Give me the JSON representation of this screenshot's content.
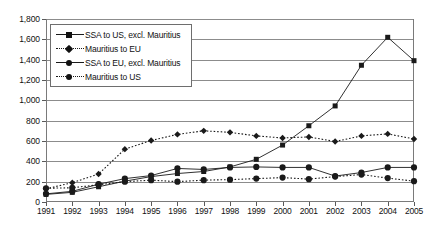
{
  "chart_data": {
    "type": "line",
    "title": "",
    "subtitle": "",
    "xlabel": "",
    "ylabel": "",
    "grid": true,
    "legend_position": "top-left",
    "xlim": [
      1991,
      2005
    ],
    "ylim": [
      0,
      1800
    ],
    "ytick_step": 200,
    "categories": [
      1991,
      1992,
      1993,
      1994,
      1995,
      1996,
      1997,
      1998,
      1999,
      2000,
      2001,
      2002,
      2003,
      2004,
      2005
    ],
    "xticklabels": [
      "1991",
      "1992",
      "1993",
      "1994",
      "1995",
      "1996",
      "1997",
      "1998",
      "1999",
      "2000",
      "2001",
      "2002",
      "2003",
      "2004",
      "2005"
    ],
    "yticklabels": [
      "0",
      "200",
      "400",
      "600",
      "800",
      "1,000",
      "1,200",
      "1,400",
      "1,600",
      "1,800"
    ],
    "ytickvalues": [
      0,
      200,
      400,
      600,
      800,
      1000,
      1200,
      1400,
      1600,
      1800
    ],
    "series": [
      {
        "name": "SSA to US, excl. Mauritius",
        "marker": "square",
        "style": "solid",
        "color": "#1a1a1a",
        "values": [
          75,
          95,
          150,
          205,
          250,
          280,
          300,
          345,
          420,
          560,
          750,
          945,
          1345,
          1620,
          1390
        ]
      },
      {
        "name": "Mauritius to EU",
        "marker": "diamond",
        "style": "dotted",
        "color": "#1a1a1a",
        "values": [
          130,
          190,
          275,
          520,
          605,
          665,
          700,
          685,
          650,
          630,
          640,
          595,
          650,
          670,
          620
        ]
      },
      {
        "name": "SSA to EU, excl. Mauritius",
        "marker": "circle",
        "style": "solid",
        "color": "#1a1a1a",
        "values": [
          80,
          105,
          175,
          230,
          260,
          330,
          320,
          340,
          345,
          340,
          340,
          255,
          290,
          340,
          340
        ]
      },
      {
        "name": "Mauritius to US",
        "marker": "circle",
        "style": "dotted",
        "color": "#1a1a1a",
        "values": [
          135,
          140,
          170,
          200,
          215,
          200,
          215,
          220,
          230,
          240,
          225,
          250,
          270,
          235,
          205
        ]
      }
    ]
  },
  "legend": {
    "items": [
      {
        "label": "SSA to US, excl. Mauritius",
        "marker": "square",
        "style": "solid"
      },
      {
        "label": "Mauritius to EU",
        "marker": "diamond",
        "style": "dotted"
      },
      {
        "label": "SSA to EU, excl. Mauritius",
        "marker": "circle",
        "style": "solid"
      },
      {
        "label": "Mauritius to US",
        "marker": "circle",
        "style": "dotted"
      }
    ]
  }
}
